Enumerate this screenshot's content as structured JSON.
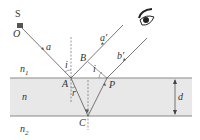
{
  "diagram": {
    "labels": {
      "source": "S",
      "origin": "O",
      "ray_a": "a",
      "ray_a_reflected": "a'",
      "ray_b_reflected": "b'",
      "point_A": "A",
      "point_B": "B",
      "point_C": "C",
      "point_P": "P",
      "angle_incidence_A": "i",
      "angle_incidence_P": "i",
      "angle_refraction": "r",
      "medium_top": "n",
      "medium_top_sub": "1",
      "medium_slab": "n",
      "medium_bottom": "n",
      "medium_bottom_sub": "2",
      "thickness": "d"
    },
    "colors": {
      "slab_fill": "#e8e8e8",
      "line": "#555555",
      "boundary": "#888888"
    },
    "elements": [
      "light-source",
      "incident-ray",
      "reflected-ray-a",
      "reflected-ray-b",
      "refracted-ray",
      "normals",
      "slab",
      "eye",
      "thickness-arrow"
    ]
  }
}
